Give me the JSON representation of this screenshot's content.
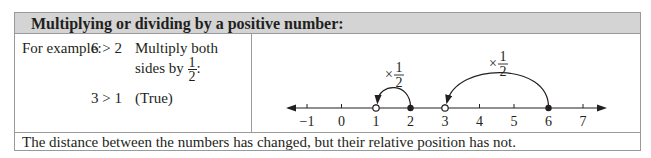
{
  "header": {
    "title": "Multiplying or dividing by a positive number:"
  },
  "example": {
    "label": "For example:",
    "inequality_before": "6 > 2",
    "instruction_line1": "Multiply both",
    "instruction_line2": "sides by",
    "fraction_num": "1",
    "fraction_den": "2",
    "instruction_suffix": ":",
    "inequality_after": "3 > 1",
    "result": "(True)"
  },
  "number_line": {
    "ticks": [
      "−1",
      "0",
      "1",
      "2",
      "3",
      "4",
      "5",
      "6",
      "7"
    ],
    "arcs": [
      {
        "from": "2",
        "to": "1",
        "label_prefix": "×",
        "label_num": "1",
        "label_den": "2"
      },
      {
        "from": "6",
        "to": "3",
        "label_prefix": "×",
        "label_num": "1",
        "label_den": "2"
      }
    ],
    "closed_points": [
      "2",
      "6"
    ],
    "open_points": [
      "1",
      "3"
    ]
  },
  "footer": {
    "text": "The distance between the numbers has changed, but their relative position has not."
  }
}
